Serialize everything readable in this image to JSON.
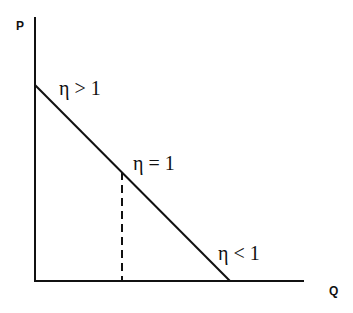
{
  "diagram": {
    "axes": {
      "y_label": "P",
      "x_label": "Q"
    },
    "annotations": [
      {
        "id": "elastic",
        "text": "η > 1"
      },
      {
        "id": "unit",
        "text": "η = 1"
      },
      {
        "id": "inelastic",
        "text": "η < 1"
      }
    ],
    "colors": {
      "line": "#111111",
      "background": "#ffffff"
    }
  }
}
